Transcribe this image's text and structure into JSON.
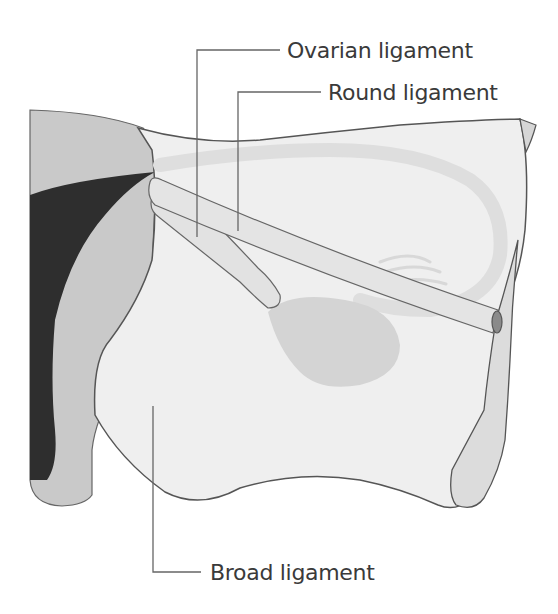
{
  "diagram": {
    "type": "anatomical-illustration",
    "labels": [
      {
        "id": "ovarian-ligament",
        "text": "Ovarian ligament"
      },
      {
        "id": "round-ligament",
        "text": "Round ligament"
      },
      {
        "id": "broad-ligament",
        "text": "Broad ligament"
      }
    ],
    "structures": [
      "uterus",
      "uterine-cavity",
      "broad-ligament",
      "ovary",
      "ovarian-ligament",
      "round-ligament",
      "uterine-tube",
      "fimbriae"
    ],
    "colors": {
      "outline": "#555555",
      "uterus": "#c9c9c9",
      "cavity": "#2e2e2e",
      "broad_ligament": "#efefef",
      "tube": "#e2e2e2",
      "ovary": "#d4d4d4",
      "leader_line": "#666666",
      "text": "#3a3a3a"
    }
  }
}
